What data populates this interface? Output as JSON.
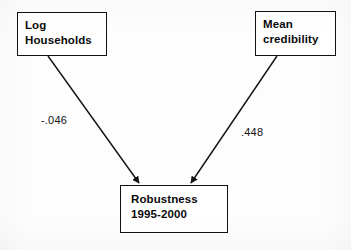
{
  "diagram": {
    "background_color": "#fdfdfd",
    "line_color": "#111111",
    "nodes": [
      {
        "id": "log_households",
        "label": "Log\nHouseholds",
        "role": "predictor"
      },
      {
        "id": "mean_credibility",
        "label": "Mean\ncredibility",
        "role": "predictor"
      },
      {
        "id": "robustness",
        "label": "Robustness\n1995-2000",
        "role": "outcome"
      }
    ],
    "edges": [
      {
        "id": "edge_households_to_robustness",
        "from": "log_households",
        "to": "robustness",
        "coefficient": "-.046",
        "arrowhead": "filled-triangle"
      },
      {
        "id": "edge_credibility_to_robustness",
        "from": "mean_credibility",
        "to": "robustness",
        "coefficient": ".448",
        "arrowhead": "filled-triangle"
      }
    ]
  }
}
